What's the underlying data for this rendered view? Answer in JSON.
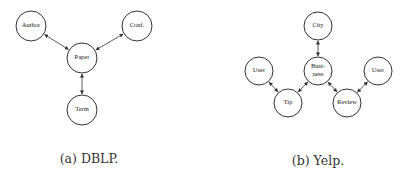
{
  "figures": [
    {
      "id": "dblp",
      "caption": "(a) DBLP.",
      "caption_pos": [
        89,
        151
      ],
      "node_radius": 15,
      "nodes": [
        {
          "id": "author",
          "label": "Author",
          "x": 31,
          "y": 26
        },
        {
          "id": "conf",
          "label": "Conf.",
          "x": 137,
          "y": 26
        },
        {
          "id": "paper",
          "label": "Paper",
          "x": 82,
          "y": 58
        },
        {
          "id": "term",
          "label": "Term",
          "x": 82,
          "y": 110
        }
      ],
      "edges": [
        {
          "from": "author",
          "to": "paper"
        },
        {
          "from": "conf",
          "to": "paper"
        },
        {
          "from": "paper",
          "to": "term"
        }
      ]
    },
    {
      "id": "yelp",
      "caption": "(b) Yelp.",
      "caption_pos": [
        318,
        153
      ],
      "node_radius": 14,
      "nodes": [
        {
          "id": "city",
          "label": "City",
          "x": 318,
          "y": 26
        },
        {
          "id": "business",
          "label": [
            "Busi-",
            "ness"
          ],
          "x": 318,
          "y": 71
        },
        {
          "id": "user1",
          "label": "User",
          "x": 259,
          "y": 71
        },
        {
          "id": "tip",
          "label": "Tip",
          "x": 288,
          "y": 103
        },
        {
          "id": "review",
          "label": "Review",
          "x": 347,
          "y": 103
        },
        {
          "id": "user2",
          "label": "User",
          "x": 378,
          "y": 71
        }
      ],
      "edges": [
        {
          "from": "city",
          "to": "business"
        },
        {
          "from": "user1",
          "to": "tip"
        },
        {
          "from": "tip",
          "to": "business"
        },
        {
          "from": "business",
          "to": "review"
        },
        {
          "from": "review",
          "to": "user2"
        }
      ]
    }
  ]
}
